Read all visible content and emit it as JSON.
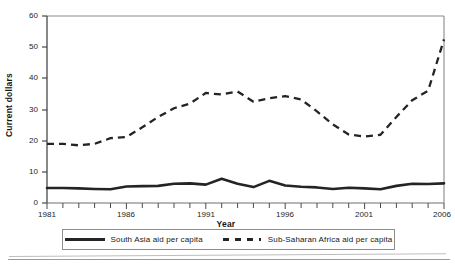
{
  "chart_data": {
    "type": "line",
    "title": "",
    "xlabel": "Year",
    "ylabel": "Current dollars",
    "xlim": [
      1981,
      2006
    ],
    "ylim": [
      0,
      60
    ],
    "yticks": [
      0,
      10,
      20,
      30,
      40,
      50,
      60
    ],
    "xticks": [
      1981,
      1986,
      1991,
      1996,
      2001,
      2006
    ],
    "xtick_labels": [
      "1981",
      "1986",
      "1991",
      "1996",
      "2001",
      "2006"
    ],
    "ytick_labels": [
      "0",
      "10",
      "20",
      "30",
      "40",
      "50",
      "60"
    ],
    "grid": false,
    "legend_position": "below",
    "x": [
      1981,
      1982,
      1983,
      1984,
      1985,
      1986,
      1987,
      1988,
      1989,
      1990,
      1991,
      1992,
      1993,
      1994,
      1995,
      1996,
      1997,
      1998,
      1999,
      2000,
      2001,
      2002,
      2003,
      2004,
      2005,
      2006
    ],
    "series": [
      {
        "name": "South Asia aid per capita",
        "style": "solid",
        "color": "#242424",
        "values": [
          4.8,
          4.8,
          4.7,
          4.5,
          4.4,
          5.3,
          5.4,
          5.5,
          6.2,
          6.3,
          5.9,
          7.8,
          6.2,
          5.1,
          7.1,
          5.6,
          5.2,
          5.0,
          4.5,
          4.9,
          4.7,
          4.4,
          5.5,
          6.2,
          6.1,
          6.3
        ]
      },
      {
        "name": "Sub-Saharan Africa aid per capita",
        "style": "dashed",
        "color": "#242424",
        "values": [
          19.0,
          19.0,
          18.5,
          19.0,
          20.8,
          21.2,
          24.3,
          27.6,
          30.4,
          31.9,
          35.3,
          34.8,
          35.8,
          32.5,
          33.6,
          34.3,
          33.2,
          29.4,
          25.2,
          22.0,
          21.3,
          21.9,
          27.6,
          33.0,
          36.0,
          52.5
        ]
      }
    ],
    "series_late": {
      "note": "solid series continues to 8.3 and dashed to 52.5 at 2006"
    },
    "legend": [
      {
        "label": "South Asia aid per capita",
        "style": "solid"
      },
      {
        "label": "Sub-Saharan Africa aid per capita",
        "style": "dashed"
      }
    ]
  },
  "axes": {
    "y_title": "Current dollars",
    "x_title": "Year"
  }
}
